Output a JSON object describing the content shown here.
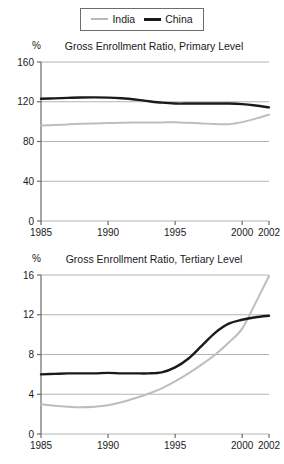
{
  "legend": {
    "position": "top-center",
    "entries": [
      {
        "label": "India",
        "color": "#bdbdbd",
        "icon": "line-swatch-icon"
      },
      {
        "label": "China",
        "color": "#1a1a1a",
        "icon": "line-swatch-icon"
      }
    ]
  },
  "chart_data": [
    {
      "type": "line",
      "title": "Gross Enrollment Ratio, Primary Level",
      "xlabel": "",
      "ylabel": "%",
      "ylim": [
        0,
        160
      ],
      "xlim": [
        1985,
        2002
      ],
      "yticks": [
        "0",
        "40",
        "80",
        "120",
        "160"
      ],
      "ytick_values": [
        0,
        40,
        80,
        120,
        160
      ],
      "xticks": [
        "1985",
        "1990",
        "1995",
        "2000",
        "2002"
      ],
      "xtick_values": [
        1985,
        1990,
        1995,
        2000,
        2002
      ],
      "grid": true,
      "legend_position": "above-figure",
      "x": [
        1985,
        1986,
        1987,
        1988,
        1989,
        1990,
        1991,
        1992,
        1993,
        1994,
        1995,
        1996,
        1997,
        1998,
        1999,
        2000,
        2001,
        2002
      ],
      "series": [
        {
          "name": "India",
          "color": "#bdbdbd",
          "values": [
            96,
            96.5,
            97.2,
            97.8,
            98.2,
            98.5,
            98.8,
            99,
            99.1,
            99.2,
            99.3,
            98.8,
            98.2,
            97.6,
            97.4,
            99.5,
            103,
            107
          ]
        },
        {
          "name": "China",
          "color": "#1a1a1a",
          "values": [
            123,
            123.4,
            123.9,
            124.3,
            124.4,
            124.2,
            123.5,
            122.3,
            120.6,
            119.1,
            118.2,
            118.2,
            118.3,
            118.3,
            118.2,
            117.6,
            116.2,
            114.3
          ]
        }
      ]
    },
    {
      "type": "line",
      "title": "Gross Enrollment Ratio, Tertiary Level",
      "xlabel": "",
      "ylabel": "%",
      "ylim": [
        0,
        16
      ],
      "xlim": [
        1985,
        2002
      ],
      "yticks": [
        "0",
        "4",
        "8",
        "12",
        "16"
      ],
      "ytick_values": [
        0,
        4,
        8,
        12,
        16
      ],
      "xticks": [
        "1985",
        "1990",
        "1995",
        "2000",
        "2002"
      ],
      "xtick_values": [
        1985,
        1990,
        1995,
        2000,
        2002
      ],
      "grid": true,
      "legend_position": "above-figure",
      "x": [
        1985,
        1986,
        1987,
        1988,
        1989,
        1990,
        1991,
        1992,
        1993,
        1994,
        1995,
        1996,
        1997,
        1998,
        1999,
        2000,
        2001,
        2002
      ],
      "series": [
        {
          "name": "India",
          "color": "#bdbdbd",
          "values": [
            3.0,
            2.85,
            2.75,
            2.7,
            2.75,
            2.9,
            3.2,
            3.6,
            4.05,
            4.6,
            5.3,
            6.1,
            7.0,
            8.0,
            9.2,
            10.6,
            13.2,
            15.9
          ]
        },
        {
          "name": "China",
          "color": "#1a1a1a",
          "values": [
            6.0,
            6.05,
            6.1,
            6.1,
            6.1,
            6.15,
            6.1,
            6.1,
            6.1,
            6.2,
            6.7,
            7.6,
            8.9,
            10.2,
            11.1,
            11.5,
            11.75,
            11.9
          ]
        }
      ]
    }
  ]
}
